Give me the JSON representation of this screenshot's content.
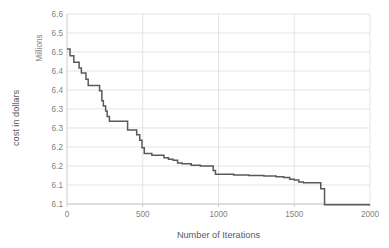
{
  "chart_data": {
    "type": "line",
    "title": "",
    "xlabel": "Number of Iterations",
    "ylabel": "cost in dollars",
    "y_unit_label": "Millions",
    "xlim": [
      0,
      2000
    ],
    "ylim": [
      6.1,
      6.6
    ],
    "xticks": [
      0,
      500,
      1000,
      1500,
      2000
    ],
    "xtick_labels": [
      "0",
      "500",
      "1000",
      "1500",
      "2000"
    ],
    "yticks": [
      6.1,
      6.15,
      6.2,
      6.25,
      6.3,
      6.35,
      6.4,
      6.45,
      6.5,
      6.55,
      6.6
    ],
    "ytick_labels": [
      "6.1",
      "6.1",
      "6.2",
      "6.2",
      "6.3",
      "6.3",
      "6.4",
      "6.4",
      "6.5",
      "6.5",
      "6.6"
    ],
    "grid": true,
    "legend": "none",
    "line_color": "#595959",
    "grid_color": "#d9d9d9",
    "axis_color": "#bfbfbf",
    "text_color": "#7f7f7f",
    "series": [
      {
        "name": "cost",
        "x": [
          0,
          10,
          20,
          30,
          45,
          60,
          80,
          95,
          110,
          125,
          140,
          160,
          180,
          200,
          215,
          230,
          240,
          255,
          265,
          280,
          300,
          330,
          360,
          385,
          400,
          420,
          440,
          460,
          480,
          495,
          510,
          530,
          560,
          600,
          640,
          670,
          700,
          730,
          760,
          790,
          820,
          850,
          880,
          920,
          950,
          965,
          980,
          1010,
          1100,
          1200,
          1300,
          1380,
          1430,
          1470,
          1500,
          1530,
          1560,
          1600,
          1650,
          1675,
          1700,
          1800,
          1900,
          1980
        ],
        "y": [
          6.508,
          6.508,
          6.49,
          6.49,
          6.473,
          6.473,
          6.458,
          6.445,
          6.445,
          6.428,
          6.412,
          6.412,
          6.412,
          6.412,
          6.398,
          6.372,
          6.358,
          6.345,
          6.33,
          6.318,
          6.318,
          6.318,
          6.318,
          6.318,
          6.295,
          6.295,
          6.295,
          6.282,
          6.268,
          6.248,
          6.233,
          6.233,
          6.228,
          6.228,
          6.222,
          6.218,
          6.215,
          6.208,
          6.206,
          6.206,
          6.202,
          6.202,
          6.2,
          6.2,
          6.2,
          6.188,
          6.178,
          6.178,
          6.176,
          6.175,
          6.174,
          6.172,
          6.17,
          6.165,
          6.163,
          6.158,
          6.156,
          6.156,
          6.156,
          6.14,
          6.098,
          6.098,
          6.098,
          6.098
        ]
      }
    ],
    "plot_area": {
      "left": 67,
      "right": 370,
      "top": 14,
      "bottom": 204
    }
  }
}
